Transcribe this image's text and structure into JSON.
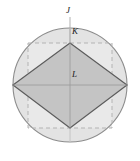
{
  "figure": {
    "name": "circle-with-inscribed-and-circumscribed-squares",
    "background_color": "#ffffff",
    "colors": {
      "circle_stroke": "#8c8c8c",
      "circle_fill": "#ffffff",
      "shaded_region_fill": "#e2e2e2",
      "diamond_fill": "#c3c3c3",
      "diamond_stroke": "#5a5a5a",
      "dashed_square_stroke": "#b5b5b5",
      "axis_stroke": "#bdbdbd",
      "label_color": "#1a1a1a"
    },
    "circle": {
      "name": "outer-circle",
      "center_x": 70,
      "center_y": 85,
      "radius": 57
    },
    "dashed_square": {
      "name": "circumscribed-dashed-square",
      "left": 28,
      "top": 43,
      "right": 112,
      "bottom": 128,
      "dash_pattern": "4 3"
    },
    "diamond": {
      "name": "inscribed-rotated-square",
      "points": "70,43 127,85 70,128 13,85",
      "vertices": {
        "top": [
          70,
          43
        ],
        "right": [
          127,
          85
        ],
        "bottom": [
          70,
          128
        ],
        "left": [
          13,
          85
        ]
      }
    },
    "axes": {
      "name": "center-crosshair",
      "horizontal": {
        "x1": 13,
        "y1": 85,
        "x2": 127,
        "y2": 85
      },
      "vertical": {
        "x1": 70,
        "y1": 28,
        "x2": 70,
        "y2": 142
      }
    },
    "labels": [
      {
        "id": "J",
        "text": "J",
        "x": 66,
        "y": 6,
        "target": "top-of-circle"
      },
      {
        "id": "K",
        "text": "K",
        "x": 72,
        "y": 27,
        "target": "top-vertex-of-diamond"
      },
      {
        "id": "L",
        "text": "L",
        "x": 72,
        "y": 70,
        "target": "center-of-figure"
      }
    ],
    "leader_line_J": {
      "x1": 70,
      "y1": 16,
      "x2": 70,
      "y2": 43
    }
  }
}
